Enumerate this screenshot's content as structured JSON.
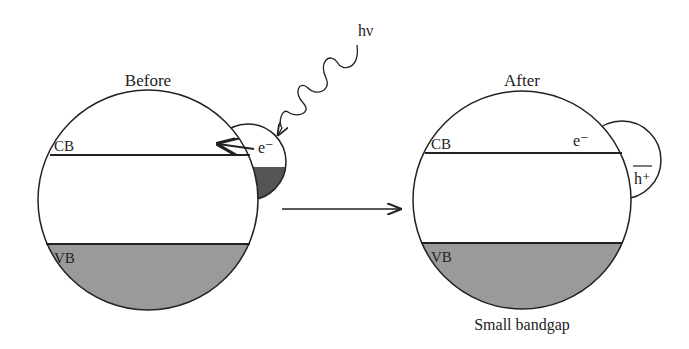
{
  "diagram": {
    "before": {
      "title": "Before",
      "cb_label": "CB",
      "vb_label": "VB",
      "electron_label": "e⁻",
      "photon_label": "hν"
    },
    "after": {
      "title": "After",
      "cb_label": "CB",
      "vb_label": "VB",
      "electron_label": "e⁻",
      "hole_label": "h⁺",
      "caption": "Small bandgap"
    },
    "colors": {
      "outline": "#222222",
      "vb_fill": "#9a9a9a",
      "sensitizer_fill": "#555555",
      "background": "#ffffff"
    }
  }
}
